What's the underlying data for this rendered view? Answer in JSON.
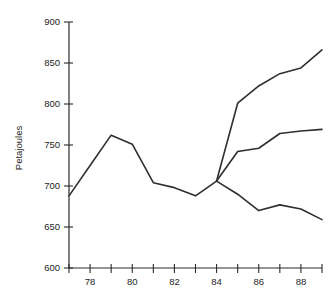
{
  "chart_data": {
    "type": "line",
    "title": "",
    "xlabel": "",
    "ylabel": "Petajoules",
    "xlim": [
      77,
      89
    ],
    "ylim": [
      600,
      900
    ],
    "grid": false,
    "legend": "none",
    "x_ticks": [
      77,
      78,
      79,
      80,
      81,
      82,
      83,
      84,
      85,
      86,
      87,
      88,
      89
    ],
    "x_tick_labels": [
      "",
      "78",
      "",
      "80",
      "",
      "82",
      "",
      "84",
      "",
      "86",
      "",
      "88",
      ""
    ],
    "y_ticks": [
      600,
      650,
      700,
      750,
      800,
      850,
      900
    ],
    "y_tick_labels": [
      "600",
      "650",
      "700",
      "750",
      "800",
      "850",
      "900"
    ],
    "series": [
      {
        "name": "historical",
        "x": [
          77,
          78,
          79,
          80,
          81,
          82,
          83,
          84
        ],
        "values": [
          688,
          725,
          762,
          751,
          704,
          698,
          688,
          706
        ]
      },
      {
        "name": "high-projection",
        "x": [
          84,
          85,
          86,
          87,
          88,
          89
        ],
        "values": [
          706,
          801,
          822,
          837,
          844,
          866
        ]
      },
      {
        "name": "mid-projection",
        "x": [
          84,
          85,
          86,
          87,
          88,
          89
        ],
        "values": [
          706,
          742,
          746,
          764,
          767,
          769
        ]
      },
      {
        "name": "low-projection",
        "x": [
          84,
          85,
          86,
          87,
          88,
          89
        ],
        "values": [
          706,
          690,
          670,
          677,
          672,
          659
        ]
      }
    ],
    "colors": {
      "line": "#2f2f2f",
      "axis": "#2b2b2b",
      "text": "#1d1d1d",
      "background": "#ffffff"
    }
  },
  "labels": {
    "y_axis_title": "Petajoules"
  }
}
